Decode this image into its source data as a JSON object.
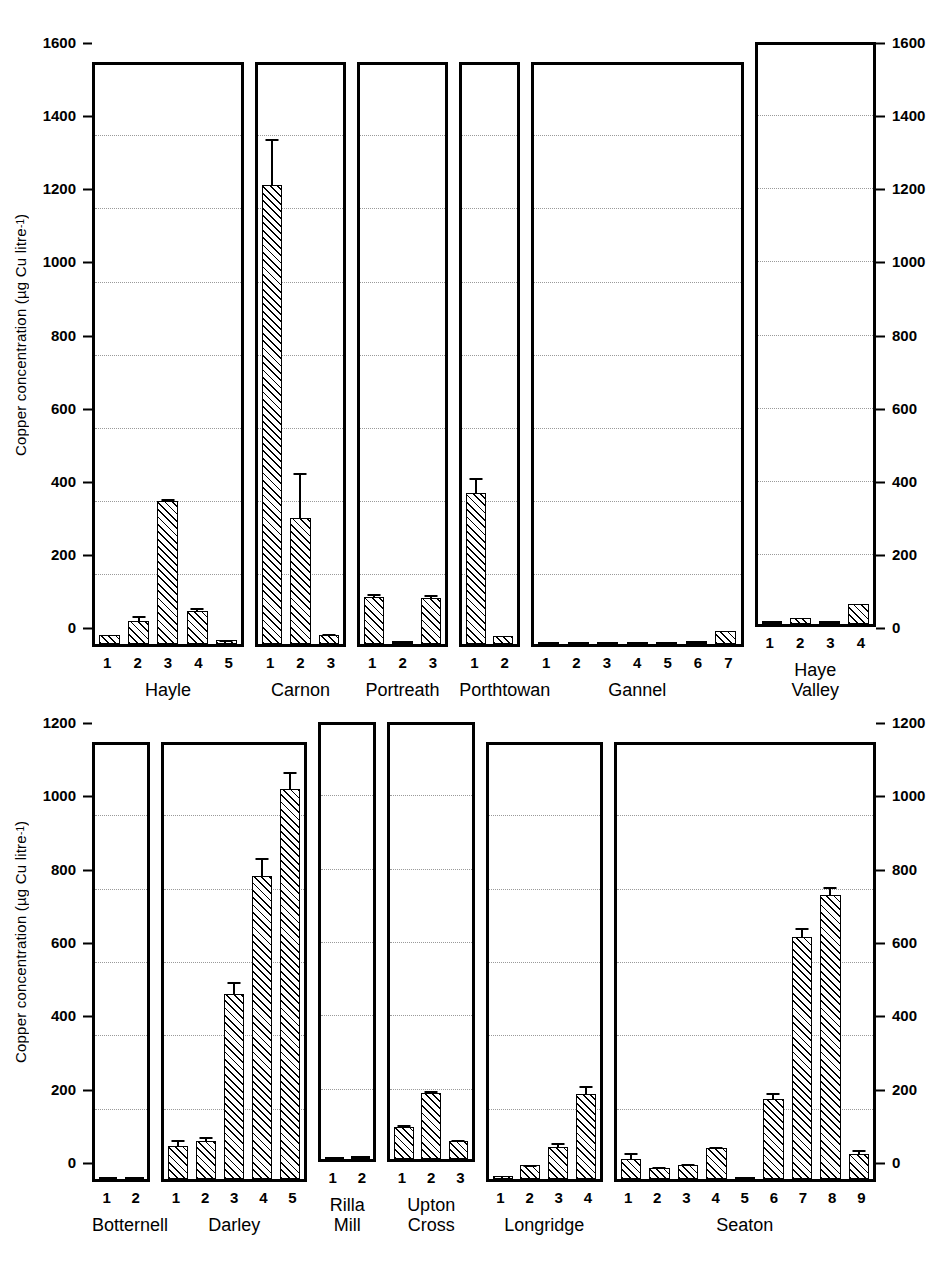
{
  "chart_data": [
    {
      "type": "bar",
      "panel_index": 0,
      "title": "",
      "xlabel": "",
      "ylabel": "Copper concentration (µg Cu litre⁻¹)",
      "ylim": [
        0,
        1600
      ],
      "yticks": [
        0,
        200,
        400,
        600,
        800,
        1000,
        1200,
        1400,
        1600
      ],
      "ytick_labels": [
        "0",
        "200",
        "400",
        "600",
        "800",
        "1000",
        "1200",
        "1400",
        "1600"
      ],
      "grid": true,
      "legend": "none",
      "axis_labels_both_sides": true,
      "groups": [
        {
          "name": "Hayle",
          "categories": [
            "1",
            "2",
            "3",
            "4",
            "5"
          ],
          "values": [
            25,
            65,
            395,
            93,
            12
          ],
          "errors": [
            0,
            17,
            8,
            9,
            3
          ]
        },
        {
          "name": "Carnon",
          "categories": [
            "1",
            "2",
            "3"
          ],
          "values": [
            1270,
            350,
            25
          ],
          "errors": [
            130,
            125,
            5
          ]
        },
        {
          "name": "Portreath",
          "categories": [
            "1",
            "2",
            "3"
          ],
          "values": [
            130,
            5,
            127
          ],
          "errors": [
            12,
            0,
            12
          ]
        },
        {
          "name": "Porthtowan",
          "categories": [
            "1",
            "2"
          ],
          "values": [
            418,
            22
          ],
          "errors": [
            45,
            0
          ]
        },
        {
          "name": "Gannel",
          "categories": [
            "1",
            "2",
            "3",
            "4",
            "5",
            "6",
            "7"
          ],
          "values": [
            0,
            0,
            0,
            0,
            0,
            3,
            37
          ],
          "errors": [
            0,
            0,
            0,
            0,
            0,
            0,
            0
          ]
        },
        {
          "name": "Haye\nValley",
          "categories": [
            "1",
            "2",
            "3",
            "4"
          ],
          "values": [
            6,
            18,
            2,
            55
          ],
          "errors": [
            0,
            0,
            0,
            0
          ]
        }
      ]
    },
    {
      "type": "bar",
      "panel_index": 1,
      "title": "",
      "xlabel": "",
      "ylabel": "Copper concentration (µg Cu litre⁻¹)",
      "ylim": [
        0,
        1200
      ],
      "yticks": [
        0,
        200,
        400,
        600,
        800,
        1000,
        1200
      ],
      "ytick_labels": [
        "0",
        "200",
        "400",
        "600",
        "800",
        "1000",
        "1200"
      ],
      "grid": true,
      "legend": "none",
      "axis_labels_both_sides": true,
      "groups": [
        {
          "name": "Botternell",
          "categories": [
            "1",
            "2"
          ],
          "values": [
            0,
            0
          ],
          "errors": [
            0,
            0
          ]
        },
        {
          "name": "Darley",
          "categories": [
            "1",
            "2",
            "3",
            "4",
            "5"
          ],
          "values": [
            93,
            105,
            512,
            838,
            1078
          ],
          "errors": [
            18,
            15,
            35,
            52,
            50
          ]
        },
        {
          "name": "Rilla\nMill",
          "categories": [
            "1",
            "2"
          ],
          "values": [
            0,
            4
          ],
          "errors": [
            0,
            0
          ]
        },
        {
          "name": "Upton\nCross",
          "categories": [
            "1",
            "2",
            "3"
          ],
          "values": [
            88,
            182,
            50
          ],
          "errors": [
            10,
            10,
            5
          ]
        },
        {
          "name": "Longridge",
          "categories": [
            "1",
            "2",
            "3",
            "4"
          ],
          "values": [
            10,
            38,
            88,
            235
          ],
          "errors": [
            0,
            5,
            16,
            25
          ]
        },
        {
          "name": "Seaton",
          "categories": [
            "1",
            "2",
            "3",
            "4",
            "5",
            "6",
            "7",
            "8",
            "9"
          ],
          "values": [
            55,
            30,
            38,
            85,
            0,
            222,
            670,
            785,
            70
          ],
          "errors": [
            20,
            6,
            8,
            6,
            0,
            18,
            28,
            25,
            14
          ]
        }
      ]
    }
  ]
}
